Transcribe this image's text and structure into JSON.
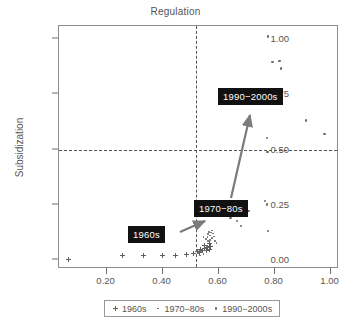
{
  "chart_data": {
    "type": "scatter",
    "title": "Regulation",
    "xlabel": "",
    "ylabel": "Subsidization",
    "xlim": [
      0.03,
      1.03
    ],
    "ylim": [
      -0.04,
      1.06
    ],
    "grid": true,
    "gridlines": {
      "horizontal": [
        0.5
      ],
      "vertical": [
        0.52
      ],
      "style": "dashed"
    },
    "xticks": [
      "0.20",
      "0.40",
      "0.60",
      "0.80",
      "1.00"
    ],
    "xtick_values": [
      0.2,
      0.4,
      0.6,
      0.8,
      1.0
    ],
    "yticks": [
      "0.00",
      "0.25",
      "0.50",
      "0.75",
      "1.00"
    ],
    "ytick_values": [
      0.0,
      0.25,
      0.5,
      0.75,
      1.0
    ],
    "legend_position": "bottom",
    "series": [
      {
        "name": "1960s",
        "marker": "plus",
        "points": [
          [
            0.065,
            0.005
          ],
          [
            0.258,
            0.02
          ],
          [
            0.333,
            0.02
          ],
          [
            0.398,
            0.019
          ],
          [
            0.447,
            0.019
          ],
          [
            0.487,
            0.024
          ],
          [
            0.512,
            0.03
          ],
          [
            0.524,
            0.04
          ],
          [
            0.531,
            0.034
          ],
          [
            0.537,
            0.05
          ],
          [
            0.544,
            0.046
          ],
          [
            0.551,
            0.052
          ],
          [
            0.556,
            0.044
          ],
          [
            0.561,
            0.056
          ],
          [
            0.566,
            0.049
          ],
          [
            0.572,
            0.06
          ],
          [
            0.551,
            0.068
          ],
          [
            0.566,
            0.074
          ]
        ]
      },
      {
        "name": "1970-80s",
        "marker": "dot-small",
        "points": [
          [
            0.528,
            0.03
          ],
          [
            0.534,
            0.022
          ],
          [
            0.54,
            0.038
          ],
          [
            0.546,
            0.028
          ],
          [
            0.552,
            0.044
          ],
          [
            0.556,
            0.095
          ],
          [
            0.56,
            0.105
          ],
          [
            0.563,
            0.118
          ],
          [
            0.566,
            0.128
          ],
          [
            0.57,
            0.112
          ],
          [
            0.573,
            0.126
          ],
          [
            0.576,
            0.134
          ],
          [
            0.58,
            0.12
          ],
          [
            0.562,
            0.086
          ],
          [
            0.57,
            0.092
          ],
          [
            0.577,
            0.1
          ],
          [
            0.583,
            0.108
          ],
          [
            0.546,
            0.106
          ],
          [
            0.588,
            0.086
          ],
          [
            0.592,
            0.078
          ],
          [
            0.558,
            0.064
          ]
        ]
      },
      {
        "name": "1990-2000s",
        "marker": "dot",
        "points": [
          [
            0.777,
            1.012
          ],
          [
            0.793,
            0.896
          ],
          [
            0.817,
            0.902
          ],
          [
            0.822,
            0.868
          ],
          [
            0.913,
            0.632
          ],
          [
            0.978,
            0.572
          ],
          [
            0.772,
            0.552
          ],
          [
            0.775,
            0.489
          ],
          [
            0.766,
            0.268
          ],
          [
            0.772,
            0.252
          ],
          [
            0.776,
            0.132
          ],
          [
            0.68,
            0.155
          ],
          [
            0.666,
            0.178
          ],
          [
            0.642,
            0.19
          ],
          [
            0.707,
            0.222
          ]
        ]
      }
    ],
    "annotations": [
      {
        "label": "1960s",
        "box_x": 128,
        "box_y": 226
      },
      {
        "label": "1970−80s",
        "box_x": 194,
        "box_y": 200
      },
      {
        "label": "1990−2000s",
        "box_x": 218,
        "box_y": 88
      }
    ],
    "legend": [
      {
        "label": "1960s",
        "marker": "plus"
      },
      {
        "label": "1970−80s",
        "marker": "dot-small"
      },
      {
        "label": "1990−2000s",
        "marker": "dot"
      }
    ]
  }
}
